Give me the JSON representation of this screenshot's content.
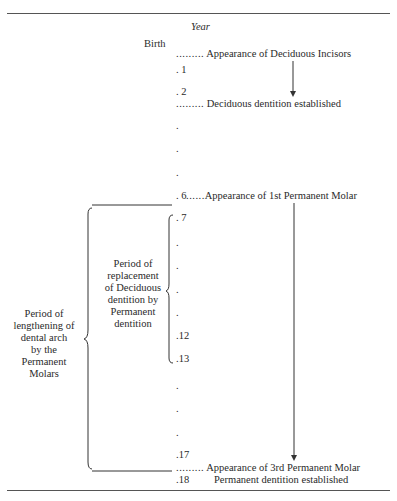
{
  "header": {
    "year_label": "Year",
    "birth_label": "Birth"
  },
  "ticks": [
    {
      "label": ". 1"
    },
    {
      "label": ". 2"
    },
    {
      "label": "."
    },
    {
      "label": "."
    },
    {
      "label": "."
    },
    {
      "label": ". 6"
    },
    {
      "label": ". 7"
    },
    {
      "label": "."
    },
    {
      "label": "."
    },
    {
      "label": "."
    },
    {
      "label": "."
    },
    {
      "label": ".12"
    },
    {
      "label": ".13"
    },
    {
      "label": "."
    },
    {
      "label": "."
    },
    {
      "label": "."
    },
    {
      "label": ".17"
    },
    {
      "label": ".18"
    }
  ],
  "events": {
    "deciduous_incisors": {
      "leader": ".........",
      "text": "Appearance of Deciduous Incisors"
    },
    "deciduous_established": {
      "leader": ".........",
      "text": "Deciduous dentition established"
    },
    "first_molar": {
      "leader": "......",
      "text": "Appearance of 1st Permanent Molar"
    },
    "third_molar": {
      "leader": ".........",
      "text": "Appearance of 3rd Permanent Molar"
    },
    "permanent_established": {
      "text": "Permanent dentition established"
    }
  },
  "periods": {
    "replacement": [
      "Period of",
      "replacement",
      "of Deciduous",
      "dentition by",
      "Permanent",
      "dentition"
    ],
    "lengthening": [
      "Period of",
      "lengthening of",
      "dental arch",
      "by the",
      "Permanent",
      "Molars"
    ]
  }
}
